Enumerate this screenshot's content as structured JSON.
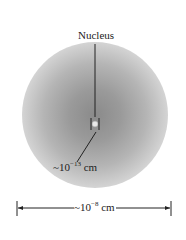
{
  "diagram": {
    "nucleus_label": "Nucleus",
    "nucleus_size_label": {
      "prefix": "~10",
      "exponent": "−13",
      "unit": " cm"
    },
    "atom_size_label": {
      "prefix": "~10",
      "exponent": "−8",
      "unit": " cm"
    },
    "colors": {
      "cloud_center": "#8a8a8a",
      "line": "#222222",
      "background": "#ffffff"
    }
  }
}
